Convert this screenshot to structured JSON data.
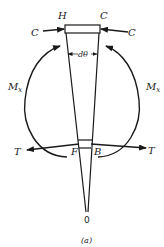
{
  "diagram": {
    "caption": "(a)",
    "labels": {
      "top_left": "H",
      "top_right": "C",
      "force_left": "C",
      "force_right": "C",
      "angle": "dθ",
      "moment_left": "M",
      "moment_left_sub": "x",
      "moment_right": "M",
      "moment_right_sub": "x",
      "tension_left": "T",
      "tension_right": "T",
      "bottom_left": "F",
      "bottom_right": "B",
      "apex": "0"
    },
    "colors": {
      "stroke": "#1a1a1a",
      "background": "#ffffff"
    }
  }
}
